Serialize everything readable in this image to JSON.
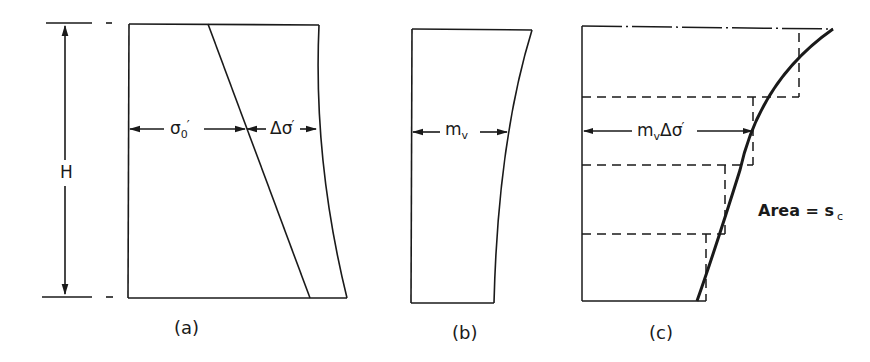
{
  "figure": {
    "panels": [
      {
        "id": "a",
        "caption": "(a)",
        "height_label": "H",
        "labels": {
          "initial_stress": {
            "symbol": "σ",
            "subscript": "0",
            "prime": "′"
          },
          "stress_increment": {
            "symbol": "Δσ",
            "prime": "′"
          }
        }
      },
      {
        "id": "b",
        "caption": "(b)",
        "labels": {
          "compressibility": {
            "symbol": "m",
            "subscript": "v"
          }
        }
      },
      {
        "id": "c",
        "caption": "(c)",
        "labels": {
          "strain": {
            "symbol": "m",
            "subscript": "v",
            "rest": "Δσ",
            "prime": "′"
          },
          "area": {
            "text": "Area = s",
            "subscript": "c"
          }
        },
        "steps": 4
      }
    ],
    "colors": {
      "line": "#1a1a1a",
      "background": "#ffffff"
    }
  }
}
